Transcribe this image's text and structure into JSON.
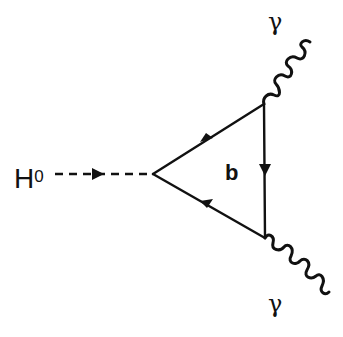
{
  "diagram": {
    "type": "feynman-diagram",
    "labels": {
      "higgs": "H",
      "higgs_superscript": "0",
      "loop_quark": "b",
      "photon_top": "γ",
      "photon_bottom": "γ"
    },
    "colors": {
      "stroke": "#111111",
      "background": "#ffffff"
    },
    "vertices": {
      "left": [
        153,
        174
      ],
      "top_right": [
        264,
        104
      ],
      "bottom_right": [
        265,
        238
      ]
    },
    "edges": [
      {
        "from": "external-H",
        "to": "left",
        "style": "dashed",
        "arrow": "forward",
        "particle": "Higgs"
      },
      {
        "from": "left",
        "to": "top_right",
        "style": "solid",
        "arrow": "forward",
        "particle": "b"
      },
      {
        "from": "top_right",
        "to": "bottom_right",
        "style": "solid",
        "arrow": "forward",
        "particle": "b"
      },
      {
        "from": "bottom_right",
        "to": "left",
        "style": "solid",
        "arrow": "forward",
        "particle": "b"
      },
      {
        "from": "top_right",
        "to": "external-top",
        "style": "wavy",
        "particle": "photon"
      },
      {
        "from": "bottom_right",
        "to": "external-bottom",
        "style": "wavy",
        "particle": "photon"
      }
    ]
  }
}
